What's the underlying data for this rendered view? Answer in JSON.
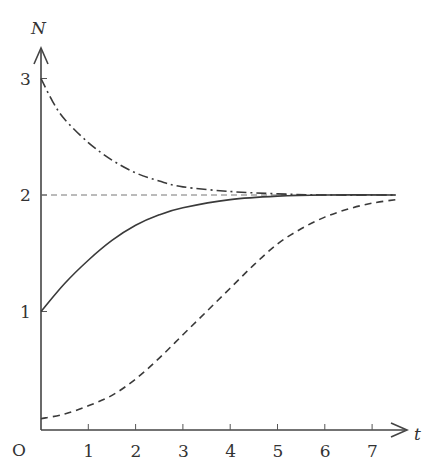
{
  "chart_data": {
    "type": "line",
    "title": "",
    "xlabel": "t",
    "ylabel": "N",
    "origin_label": "O",
    "x_ticks": [
      1,
      2,
      3,
      4,
      5,
      6,
      7
    ],
    "y_ticks": [
      1,
      2,
      3
    ],
    "xlim": [
      0,
      7.6
    ],
    "ylim": [
      0,
      3.3
    ],
    "grid": false,
    "reference_lines": [
      {
        "y": 2,
        "style": "dashed-thin",
        "label": "carrying capacity"
      }
    ],
    "series": [
      {
        "name": "N0 = 3 (decaying)",
        "style": "dash-dot",
        "x": [
          0,
          0.25,
          0.5,
          1,
          1.5,
          2,
          2.5,
          3,
          4,
          5,
          6,
          7.5
        ],
        "y": [
          3.0,
          2.8,
          2.65,
          2.45,
          2.3,
          2.19,
          2.12,
          2.07,
          2.03,
          2.01,
          2.0,
          2.0
        ]
      },
      {
        "name": "N0 = 1 (growth)",
        "style": "solid",
        "x": [
          0,
          0.5,
          1,
          1.5,
          2,
          2.5,
          3,
          4,
          5,
          6,
          7.5
        ],
        "y": [
          1.0,
          1.24,
          1.44,
          1.61,
          1.74,
          1.83,
          1.89,
          1.96,
          1.99,
          2.0,
          2.0
        ]
      },
      {
        "name": "N0 small (sigmoid)",
        "style": "dashed",
        "x": [
          0,
          0.5,
          1,
          1.5,
          2,
          2.5,
          3,
          3.5,
          4,
          4.5,
          5,
          5.5,
          6,
          6.5,
          7,
          7.5
        ],
        "y": [
          0.08,
          0.12,
          0.19,
          0.28,
          0.42,
          0.6,
          0.8,
          1.0,
          1.2,
          1.4,
          1.58,
          1.71,
          1.81,
          1.88,
          1.93,
          1.96
        ]
      }
    ],
    "legend": "none"
  }
}
